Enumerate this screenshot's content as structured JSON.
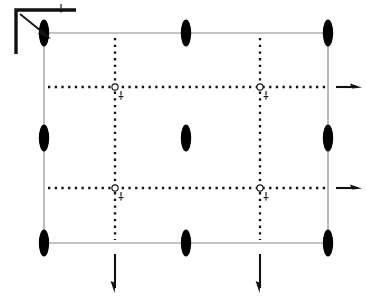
{
  "diagram": {
    "canvas": {
      "width": 367,
      "height": 304,
      "background": "#ffffff"
    },
    "colors": {
      "edge": "#8a8a8a",
      "dotted": "#111111",
      "node_fill": "#000000",
      "hinge_fill": "#ffffff",
      "arrow": "#111111"
    },
    "plate": {
      "label": "rectangular plate outline",
      "x_left": 44,
      "x_right": 328,
      "y_top": 33,
      "y_bottom": 243,
      "width": 284,
      "height": 210
    },
    "edges": [
      {
        "name": "top-edge",
        "label": "top edge",
        "x1": 44,
        "y1": 33,
        "x2": 328,
        "y2": 33
      },
      {
        "name": "right-edge",
        "label": "right edge",
        "x1": 328,
        "y1": 33,
        "x2": 328,
        "y2": 243
      },
      {
        "name": "bottom-edge",
        "label": "bottom edge",
        "x1": 44,
        "y1": 243,
        "x2": 328,
        "y2": 243
      },
      {
        "name": "left-edge",
        "label": "left edge",
        "x1": 44,
        "y1": 33,
        "x2": 44,
        "y2": 243
      }
    ],
    "dotted_lines": {
      "vertical": [
        {
          "name": "dotted-vertical-left",
          "x": 115,
          "y1": 38,
          "y2": 240
        },
        {
          "name": "dotted-vertical-right",
          "x": 260,
          "y1": 38,
          "y2": 240
        }
      ],
      "horizontal": [
        {
          "name": "dotted-horizontal-upper",
          "y": 87,
          "x1": 48,
          "x2": 325
        },
        {
          "name": "dotted-horizontal-lower",
          "y": 188,
          "x1": 48,
          "x2": 325
        }
      ]
    },
    "nodes": [
      {
        "name": "node-corner-top-left",
        "label": "corner node top-left",
        "x": 44,
        "y": 33,
        "kind": "lens"
      },
      {
        "name": "node-mid-top",
        "label": "midside node top",
        "x": 186,
        "y": 33,
        "kind": "lens"
      },
      {
        "name": "node-corner-top-right",
        "label": "corner node top-right",
        "x": 328,
        "y": 33,
        "kind": "lens"
      },
      {
        "name": "node-mid-left",
        "label": "midside node left",
        "x": 44,
        "y": 138,
        "kind": "lens"
      },
      {
        "name": "node-center",
        "label": "center node",
        "x": 186,
        "y": 138,
        "kind": "lens"
      },
      {
        "name": "node-mid-right",
        "label": "midside node right",
        "x": 328,
        "y": 138,
        "kind": "lens"
      },
      {
        "name": "node-corner-bottom-left",
        "label": "corner node bottom-left",
        "x": 44,
        "y": 243,
        "kind": "lens"
      },
      {
        "name": "node-mid-bottom",
        "label": "midside node bottom",
        "x": 186,
        "y": 243,
        "kind": "lens"
      },
      {
        "name": "node-corner-bottom-right",
        "label": "corner node bottom-right",
        "x": 328,
        "y": 243,
        "kind": "lens"
      }
    ],
    "node_shape": {
      "rx": 5.2,
      "ry": 13.5
    },
    "hinges": [
      {
        "name": "hinge-upper-left",
        "label": "hinge upper-left",
        "x": 115,
        "y": 87,
        "r": 3.1
      },
      {
        "name": "hinge-upper-right",
        "label": "hinge upper-right",
        "x": 260,
        "y": 87,
        "r": 3.1
      },
      {
        "name": "hinge-lower-left",
        "label": "hinge lower-left",
        "x": 115,
        "y": 188,
        "r": 3.1
      },
      {
        "name": "hinge-lower-right",
        "label": "hinge lower-right",
        "x": 260,
        "y": 188,
        "r": 3.1
      }
    ],
    "hinge_ticks": [
      {
        "name": "hinge-tick-upper-left",
        "x": 121,
        "y": 91
      },
      {
        "name": "hinge-tick-upper-right",
        "x": 266,
        "y": 91
      },
      {
        "name": "hinge-tick-lower-left",
        "x": 121,
        "y": 192
      },
      {
        "name": "hinge-tick-lower-right",
        "x": 266,
        "y": 192
      }
    ],
    "load_arrows": [
      {
        "name": "load-arrow-right-upper",
        "label": "traction arrow right upper",
        "direction": "right",
        "x1": 336,
        "y1": 87,
        "x2": 360,
        "y2": 87
      },
      {
        "name": "load-arrow-right-lower",
        "label": "traction arrow right lower",
        "direction": "right",
        "x1": 336,
        "y1": 188,
        "x2": 360,
        "y2": 188
      },
      {
        "name": "load-arrow-bottom-left",
        "label": "traction arrow bottom left",
        "direction": "down",
        "x1": 115,
        "y1": 254,
        "x2": 115,
        "y2": 292
      },
      {
        "name": "load-arrow-bottom-right",
        "label": "traction arrow bottom right",
        "direction": "down",
        "x1": 260,
        "y1": 254,
        "x2": 260,
        "y2": 292
      }
    ],
    "axis_indicator": {
      "name": "axis-indicator",
      "label": "coordinate / orientation bracket",
      "corner_x": 16,
      "corner_y": 10,
      "arm_h_x2": 76,
      "arm_v_y2": 54,
      "pointer": {
        "x1": 20,
        "y1": 14,
        "x2": 50,
        "y2": 38
      },
      "scale_tick": {
        "name": "axis-scale-tick",
        "x": 61,
        "y": 7
      }
    }
  }
}
